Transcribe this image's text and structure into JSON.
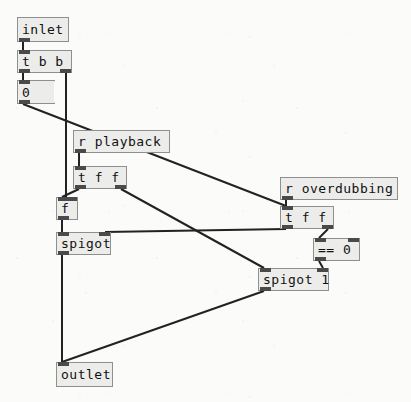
{
  "app": {
    "type": "puredata-patch-canvas",
    "title": "Pd patch",
    "canvas_size": {
      "width": 411,
      "height": 402
    },
    "background_color": "#fbfbf9",
    "box_fill_color": "#ececea",
    "box_border_color": "#8f8f8f",
    "wire_color": "#222222",
    "port_color": "#4a4a4a",
    "text_color": "#111111"
  },
  "objects": [
    {
      "id": "inlet",
      "kind": "object",
      "label": "inlet",
      "x": 17,
      "y": 17,
      "w": 52,
      "h": 25,
      "inlets": 0,
      "outlets": 1
    },
    {
      "id": "t_b_b",
      "kind": "object",
      "label": "t b b",
      "x": 17,
      "y": 50,
      "w": 55,
      "h": 23,
      "inlets": 1,
      "outlets": 2
    },
    {
      "id": "msg_0",
      "kind": "message",
      "label": "0",
      "x": 17,
      "y": 80,
      "w": 37,
      "h": 24,
      "inlets": 1,
      "outlets": 1
    },
    {
      "id": "r_playback",
      "kind": "object",
      "label": "r playback",
      "x": 73,
      "y": 130,
      "w": 97,
      "h": 23,
      "inlets": 0,
      "outlets": 1
    },
    {
      "id": "t_f_f_a",
      "kind": "object",
      "label": "t f f",
      "x": 73,
      "y": 166,
      "w": 54,
      "h": 23,
      "inlets": 1,
      "outlets": 2
    },
    {
      "id": "r_overdub",
      "kind": "object",
      "label": "r overdubbing",
      "x": 280,
      "y": 177,
      "w": 118,
      "h": 23,
      "inlets": 0,
      "outlets": 1
    },
    {
      "id": "t_f_f_b",
      "kind": "object",
      "label": "t f f",
      "x": 280,
      "y": 206,
      "w": 54,
      "h": 23,
      "inlets": 1,
      "outlets": 2
    },
    {
      "id": "f_obj",
      "kind": "object",
      "label": "f",
      "x": 56,
      "y": 197,
      "w": 22,
      "h": 23,
      "inlets": 2,
      "outlets": 1
    },
    {
      "id": "spigot",
      "kind": "object",
      "label": "spigot",
      "x": 56,
      "y": 232,
      "w": 55,
      "h": 23,
      "inlets": 2,
      "outlets": 1
    },
    {
      "id": "eq_0",
      "kind": "object",
      "label": "== 0",
      "x": 313,
      "y": 238,
      "w": 47,
      "h": 23,
      "inlets": 2,
      "outlets": 1
    },
    {
      "id": "spigot_1",
      "kind": "object",
      "label": "spigot 1",
      "x": 258,
      "y": 268,
      "w": 71,
      "h": 23,
      "inlets": 2,
      "outlets": 1
    },
    {
      "id": "outlet",
      "kind": "object",
      "label": "outlet",
      "x": 56,
      "y": 362,
      "w": 57,
      "h": 25,
      "inlets": 1,
      "outlets": 0
    }
  ],
  "connections": [
    {
      "id": "c1",
      "from": "inlet",
      "from_outlet": 0,
      "to": "t_b_b",
      "to_inlet": 0,
      "x1": 23,
      "y1": 42,
      "x2": 23,
      "y2": 50
    },
    {
      "id": "c2",
      "from": "t_b_b",
      "from_outlet": 0,
      "to": "msg_0",
      "to_inlet": 0,
      "x1": 23,
      "y1": 73,
      "x2": 23,
      "y2": 80
    },
    {
      "id": "c3",
      "from": "t_b_b",
      "from_outlet": 1,
      "to": "f_obj",
      "to_inlet": 1,
      "x1": 66,
      "y1": 73,
      "x2": 66,
      "y2": 197
    },
    {
      "id": "c4",
      "from": "msg_0",
      "from_outlet": 0,
      "to": "t_f_f_b",
      "to_inlet": 0,
      "x1": 23,
      "y1": 104,
      "x2": 286,
      "y2": 206
    },
    {
      "id": "c5",
      "from": "r_playback",
      "from_outlet": 0,
      "to": "t_f_f_a",
      "to_inlet": 0,
      "x1": 79,
      "y1": 153,
      "x2": 79,
      "y2": 166
    },
    {
      "id": "c6",
      "from": "t_f_f_a",
      "from_outlet": 0,
      "to": "f_obj",
      "to_inlet": 0,
      "x1": 79,
      "y1": 189,
      "x2": 62,
      "y2": 197
    },
    {
      "id": "c7",
      "from": "t_f_f_a",
      "from_outlet": 1,
      "to": "spigot_1",
      "to_inlet": 0,
      "x1": 121,
      "y1": 189,
      "x2": 264,
      "y2": 268
    },
    {
      "id": "c8",
      "from": "r_overdub",
      "from_outlet": 0,
      "to": "t_f_f_b",
      "to_inlet": 0,
      "x1": 286,
      "y1": 200,
      "x2": 286,
      "y2": 206
    },
    {
      "id": "c9",
      "from": "t_f_f_b",
      "from_outlet": 0,
      "to": "spigot",
      "to_inlet": 1,
      "x1": 286,
      "y1": 229,
      "x2": 105,
      "y2": 232
    },
    {
      "id": "c10",
      "from": "t_f_f_b",
      "from_outlet": 1,
      "to": "eq_0",
      "to_inlet": 0,
      "x1": 328,
      "y1": 229,
      "x2": 319,
      "y2": 238
    },
    {
      "id": "c11",
      "from": "eq_0",
      "from_outlet": 0,
      "to": "spigot_1",
      "to_inlet": 1,
      "x1": 319,
      "y1": 261,
      "x2": 323,
      "y2": 268
    },
    {
      "id": "c12",
      "from": "f_obj",
      "from_outlet": 0,
      "to": "spigot",
      "to_inlet": 0,
      "x1": 62,
      "y1": 220,
      "x2": 62,
      "y2": 232
    },
    {
      "id": "c13",
      "from": "spigot",
      "from_outlet": 0,
      "to": "outlet",
      "to_inlet": 0,
      "x1": 62,
      "y1": 255,
      "x2": 62,
      "y2": 362
    },
    {
      "id": "c14",
      "from": "spigot_1",
      "from_outlet": 0,
      "to": "outlet",
      "to_inlet": 0,
      "x1": 264,
      "y1": 291,
      "x2": 62,
      "y2": 362
    }
  ]
}
